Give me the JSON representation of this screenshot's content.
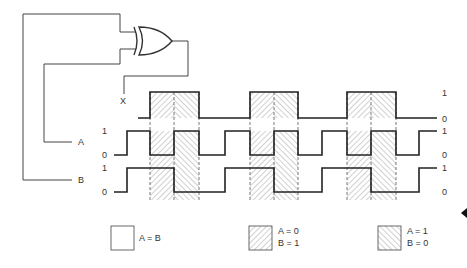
{
  "diagram": {
    "gate": {
      "type": "XOR",
      "output_label": "X"
    },
    "inputs": [
      {
        "name": "A",
        "label": "A"
      },
      {
        "name": "B",
        "label": "B"
      }
    ],
    "level_labels": {
      "high": "1",
      "low": "0"
    },
    "signals": {
      "X": {
        "label": "X",
        "transitions": [
          150,
          199,
          250,
          298,
          347,
          396
        ]
      },
      "A": {
        "label": "A",
        "transitions": [
          127,
          150,
          174,
          199,
          225,
          250,
          274,
          298,
          322,
          347,
          371,
          396,
          419
        ]
      },
      "B": {
        "label": "B",
        "transitions": [
          127,
          174,
          225,
          274,
          322,
          371,
          419
        ]
      }
    },
    "shaded_regions": [
      {
        "x0": 150,
        "x1": 174,
        "condition": "A=0,B=1"
      },
      {
        "x0": 174,
        "x1": 199,
        "condition": "A=1,B=0"
      },
      {
        "x0": 250,
        "x1": 274,
        "condition": "A=0,B=1"
      },
      {
        "x0": 274,
        "x1": 298,
        "condition": "A=1,B=0"
      },
      {
        "x0": 347,
        "x1": 371,
        "condition": "A=0,B=1"
      },
      {
        "x0": 371,
        "x1": 396,
        "condition": "A=1,B=0"
      }
    ],
    "legend": [
      {
        "id": "equal",
        "line1": "A = B",
        "line2": "",
        "pattern": "none"
      },
      {
        "id": "a0b1",
        "line1": "A = 0",
        "line2": "B = 1",
        "pattern": "forward-hatch"
      },
      {
        "id": "a1b0",
        "line1": "A = 1",
        "line2": "B = 0",
        "pattern": "backward-hatch"
      }
    ],
    "colors": {
      "line": "#222222",
      "hatch": "#888888",
      "background": "#ffffff"
    }
  }
}
